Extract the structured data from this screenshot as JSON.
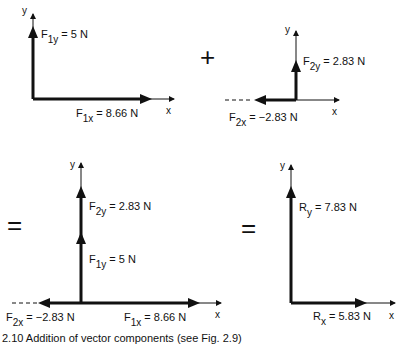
{
  "figure": {
    "operators": {
      "plus": "+",
      "equals1": "=",
      "equals2": "="
    },
    "panel1": {
      "axis_x": "x",
      "axis_y": "y",
      "fy": {
        "sym": "F",
        "sub": "1y",
        "val": " = 5 N"
      },
      "fx": {
        "sym": "F",
        "sub": "1x",
        "val": " = 8.66 N"
      }
    },
    "panel2": {
      "axis_x": "x",
      "axis_y": "y",
      "fy": {
        "sym": "F",
        "sub": "2y",
        "val": " = 2.83 N"
      },
      "fx": {
        "sym": "F",
        "sub": "2x",
        "val": " = −2.83 N"
      }
    },
    "panel3": {
      "axis_x": "x",
      "axis_y": "y",
      "f2y": {
        "sym": "F",
        "sub": "2y",
        "val": " = 2.83 N"
      },
      "f1y": {
        "sym": "F",
        "sub": "1y",
        "val": " = 5 N"
      },
      "f2x": {
        "sym": "F",
        "sub": "2x",
        "val": " = −2.83 N"
      },
      "f1x": {
        "sym": "F",
        "sub": "1x",
        "val": " = 8.66 N"
      }
    },
    "panel4": {
      "axis_x": "x",
      "axis_y": "y",
      "ry": {
        "sym": "R",
        "sub": "y",
        "val": " = 7.83 N"
      },
      "rx": {
        "sym": "R",
        "sub": "x",
        "val": " = 5.83 N"
      }
    },
    "caption": "2.10  Addition of vector components (see Fig. 2.9)"
  },
  "colors": {
    "ink": "#111111",
    "background": "#ffffff"
  }
}
